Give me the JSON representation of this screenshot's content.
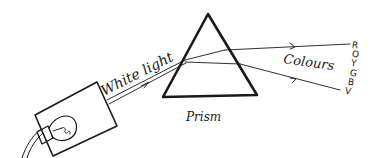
{
  "diagram": {
    "labels": {
      "white_light": "White light",
      "prism": "Prism",
      "colours": "Colours"
    },
    "spectrum": [
      "R",
      "O",
      "Y",
      "G",
      "B",
      "V"
    ],
    "components": [
      "light-source-box",
      "light-bulb",
      "power-cable",
      "white-light-beam",
      "prism",
      "refracted-rays"
    ],
    "colors": {
      "ink": "#1a1a1a",
      "background": "#ffffff"
    }
  }
}
